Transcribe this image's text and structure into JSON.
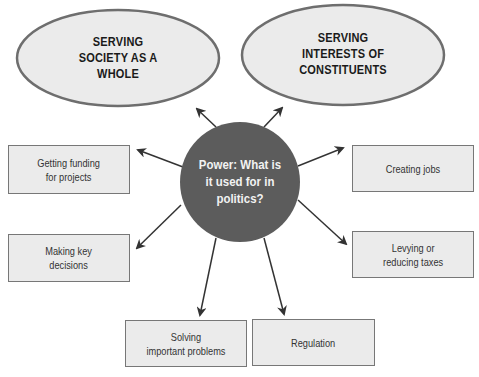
{
  "diagram": {
    "type": "concept-map",
    "colors": {
      "ellipse_fill": "#ebebeb",
      "ellipse_stroke": "#6e6e6e",
      "hub_fill": "#5c5c5c",
      "hub_text": "#f2f2f2",
      "box_fill": "#ebebeb",
      "box_stroke": "#777777",
      "arrow": "#333333"
    },
    "hub": {
      "label": "Power: What is\nit used for in\npolitics?"
    },
    "goals": [
      {
        "label": "SERVING\nSOCIETY AS A\nWHOLE"
      },
      {
        "label": "SERVING\nINTERESTS OF\nCONSTITUENTS"
      }
    ],
    "uses": [
      {
        "label": "Getting funding\nfor projects"
      },
      {
        "label": "Making key\ndecisions"
      },
      {
        "label": "Solving\nimportant problems"
      },
      {
        "label": "Regulation"
      },
      {
        "label": "Levying or\nreducing taxes"
      },
      {
        "label": "Creating jobs"
      }
    ]
  }
}
